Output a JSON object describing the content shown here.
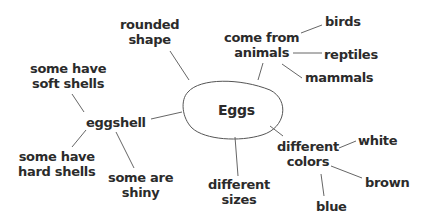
{
  "diagram": {
    "type": "concept-web",
    "center": "Eggs",
    "nodes": {
      "rounded_shape": {
        "line1": "rounded",
        "line2": "shape"
      },
      "come_from_animals": {
        "line1": "come from",
        "line2": "animals"
      },
      "birds": "birds",
      "reptiles": "reptiles",
      "mammals": "mammals",
      "eggshell": "eggshell",
      "soft_shells": {
        "line1": "some have",
        "line2": "soft shells"
      },
      "hard_shells": {
        "line1": "some have",
        "line2": "hard shells"
      },
      "shiny": {
        "line1": "some are",
        "line2": "shiny"
      },
      "sizes": {
        "line1": "different",
        "line2": "sizes"
      },
      "colors": {
        "line1": "different",
        "line2": "colors"
      },
      "white": "white",
      "brown": "brown",
      "blue": "blue"
    },
    "edges": [
      [
        "Eggs",
        "rounded shape"
      ],
      [
        "Eggs",
        "come from animals"
      ],
      [
        "come from animals",
        "birds"
      ],
      [
        "come from animals",
        "reptiles"
      ],
      [
        "come from animals",
        "mammals"
      ],
      [
        "Eggs",
        "eggshell"
      ],
      [
        "eggshell",
        "some have soft shells"
      ],
      [
        "eggshell",
        "some have hard shells"
      ],
      [
        "eggshell",
        "some are shiny"
      ],
      [
        "Eggs",
        "different sizes"
      ],
      [
        "Eggs",
        "different colors"
      ],
      [
        "different colors",
        "white"
      ],
      [
        "different colors",
        "brown"
      ],
      [
        "different colors",
        "blue"
      ]
    ],
    "line_color": "#555555",
    "text_color": "#2b2b2b"
  }
}
